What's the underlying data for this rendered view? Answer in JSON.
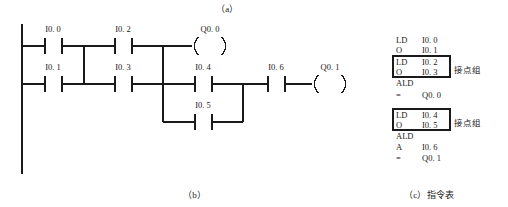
{
  "figure": {
    "captions": {
      "a": "（a）",
      "b": "（b）",
      "c": "（c）指令表"
    }
  },
  "ladder": {
    "title": "ladder-diagram",
    "rung1": {
      "contacts": [
        "I0.0",
        "I0.2"
      ],
      "coil": "Q0.0"
    },
    "rung2": {
      "contacts": [
        "I0.1",
        "I0.3"
      ],
      "parallel_top": "I0.4",
      "parallel_bottom": "I0.5",
      "series": "I0.6",
      "coil": "Q0.1"
    },
    "labels": {
      "i00": "I0. 0",
      "i02": "I0. 2",
      "q00": "Q0. 0",
      "i01": "I0. 1",
      "i03": "I0. 3",
      "i04": "I0. 4",
      "i05": "I0. 5",
      "i06": "I0. 6",
      "q01": "Q0. 1"
    }
  },
  "instruction_list": {
    "group_label": "接点组",
    "rows": [
      {
        "op": "LD",
        "operand": "I0. 0",
        "boxed": false
      },
      {
        "op": "O",
        "operand": "I0. 1",
        "boxed": false
      },
      {
        "op": "LD",
        "operand": "I0. 2",
        "boxed": true
      },
      {
        "op": "O",
        "operand": "I0. 3",
        "boxed": true
      },
      {
        "op": "ALD",
        "operand": "",
        "boxed": false
      },
      {
        "op": "=",
        "operand": "Q0. 0",
        "boxed": false
      },
      {
        "op": "LD",
        "operand": "I0. 4",
        "boxed": true
      },
      {
        "op": "O",
        "operand": "I0. 5",
        "boxed": true
      },
      {
        "op": "ALD",
        "operand": "",
        "boxed": false
      },
      {
        "op": "A",
        "operand": "I0. 6",
        "boxed": false
      },
      {
        "op": "=",
        "operand": "Q0. 1",
        "boxed": false
      }
    ]
  },
  "colors": {
    "line": "#1a1a1a",
    "background": "#ffffff"
  }
}
